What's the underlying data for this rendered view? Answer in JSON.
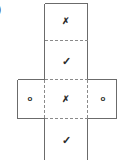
{
  "figure": {
    "type": "cube-net-diagram",
    "edge_label": ")",
    "stroke_color": "#6b6b6b",
    "dash_color": "#8a8a8a",
    "symbol_color": "#2b2b2b",
    "background": "#ffffff",
    "outline": {
      "column_left": 44,
      "column_right": 88,
      "column_top": 3,
      "column_bottom": 160,
      "bar_left": 17,
      "bar_right": 117,
      "bar_top": 79,
      "bar_bottom": 118,
      "divider_top_y": 40,
      "divider_bottom_y": 118
    },
    "cells": [
      {
        "name": "top-cell",
        "symbol": "✗",
        "symbol_name": "cross-mark",
        "glyph_class": "glyph-cross",
        "cx": 66,
        "cy": 22
      },
      {
        "name": "upper-middle-cell",
        "symbol": "✓",
        "symbol_name": "check-mark",
        "glyph_class": "glyph-check",
        "cx": 66,
        "cy": 62
      },
      {
        "name": "middle-left-cell",
        "symbol": "o",
        "symbol_name": "circle-mark",
        "glyph_class": "glyph-circle",
        "cx": 30,
        "cy": 100
      },
      {
        "name": "middle-center-cell",
        "symbol": "✗",
        "symbol_name": "cross-mark",
        "glyph_class": "glyph-cross",
        "cx": 66,
        "cy": 100
      },
      {
        "name": "middle-right-cell",
        "symbol": "o",
        "symbol_name": "circle-mark",
        "glyph_class": "glyph-circle",
        "cx": 103,
        "cy": 100
      },
      {
        "name": "bottom-cell",
        "symbol": "✓",
        "symbol_name": "check-mark",
        "glyph_class": "glyph-check",
        "cx": 66,
        "cy": 141
      }
    ]
  }
}
